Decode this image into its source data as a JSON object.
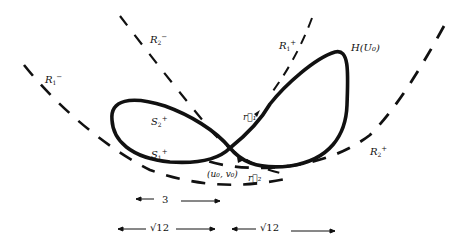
{
  "figure": {
    "type": "figure-eight homoclinic diagram",
    "labels": {
      "R1_minus": {
        "base": "R",
        "sub": "1",
        "sup": "−"
      },
      "R2_minus": {
        "base": "R",
        "sub": "2",
        "sup": "−"
      },
      "R1_plus": {
        "base": "R",
        "sub": "1",
        "sup": "+"
      },
      "R2_plus": {
        "base": "R",
        "sub": "2",
        "sup": "+"
      },
      "H_U0": "H(U₀)",
      "S2_plus": {
        "base": "S",
        "sub": "2",
        "sup": "+"
      },
      "S1_plus": {
        "base": "S",
        "sub": "1",
        "sup": "+"
      },
      "r1": "r⃗₁",
      "r2": "r⃗₂",
      "saddle_point": "(u₀, v₀)"
    },
    "dimensions": {
      "top_width": "3",
      "left_width": "√12",
      "right_width": "√12"
    },
    "colors": {
      "ink": "#111111",
      "background": "#ffffff"
    }
  }
}
